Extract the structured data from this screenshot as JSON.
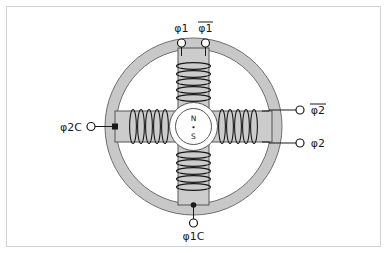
{
  "figure": {
    "kind": "stepper-motor-cross-section-schematic",
    "background_color": "#ffffff",
    "frame_border_color": "#d2d2d2",
    "ink_color": "#1a1a1a",
    "stator_fill": "#c8c8c8",
    "pole_fill": "#cccccc",
    "rotor_fill": "#ffffff"
  },
  "terminals": {
    "top_left": {
      "label": "φ1",
      "overline": false,
      "name": "phi1"
    },
    "top_right": {
      "label": "φ1",
      "overline": true,
      "name": "phi1-bar"
    },
    "right_upper": {
      "label": "φ2",
      "overline": true,
      "name": "phi2-bar"
    },
    "right_lower": {
      "label": "φ2",
      "overline": false,
      "name": "phi2"
    },
    "left": {
      "label": "φ2C",
      "overline": false,
      "name": "phi2C"
    },
    "bottom": {
      "label": "φ1C",
      "overline": false,
      "name": "phi1C"
    }
  },
  "rotor": {
    "north_label": "N",
    "south_label": "S",
    "center_marker": "•"
  }
}
